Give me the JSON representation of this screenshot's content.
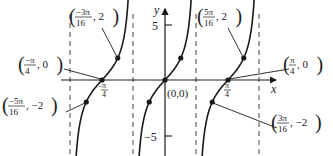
{
  "figure": {
    "function": "y = 2 tan(4x)",
    "axis_x_label": "x",
    "axis_y_label": "y",
    "y_tick_top": "5",
    "y_tick_bottom": "−5",
    "x_tick_neg": "−π/4",
    "x_tick_pos": "π/4",
    "origin_label": "(0,0)"
  },
  "annotations": [
    {
      "id": "neg-3pi16",
      "label": "(−3π/16, 2)",
      "num": "−3π",
      "den": "16",
      "rest": ", 2"
    },
    {
      "id": "neg-pi4",
      "label": "(−π/4, 0)",
      "num": "−π",
      "den": "4",
      "rest": ", 0"
    },
    {
      "id": "neg-5pi16",
      "label": "(−5π/16, −2)",
      "num": "−5π",
      "den": "16",
      "rest": ", −2"
    },
    {
      "id": "pos-5pi16",
      "label": "(5π/16, 2)",
      "num": "5π",
      "den": "16",
      "rest": ", 2"
    },
    {
      "id": "pos-pi4",
      "label": "(π/4, 0)",
      "num": "π",
      "den": "4",
      "rest": ", 0"
    },
    {
      "id": "pos-3pi16",
      "label": "(3π/16, −2)",
      "num": "3π",
      "den": "16",
      "rest": ", −2"
    }
  ],
  "colors": {
    "curve": "#1a1a1a",
    "axis": "#1a1a1a",
    "asymptote": "#555555"
  }
}
